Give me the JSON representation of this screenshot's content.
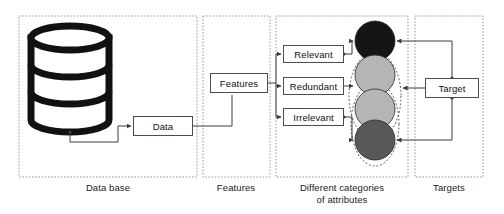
{
  "diagram": {
    "regions": [
      {
        "id": "database",
        "label": "Data base",
        "x": 19,
        "y": 16,
        "w": 178,
        "h": 161
      },
      {
        "id": "features",
        "label": "Features",
        "x": 203,
        "y": 16,
        "w": 67,
        "h": 161
      },
      {
        "id": "categories",
        "label": "Different categories\nof attributes",
        "x": 276,
        "y": 16,
        "w": 132,
        "h": 161
      },
      {
        "id": "targets",
        "label": "Targets",
        "x": 415,
        "y": 16,
        "w": 68,
        "h": 161
      }
    ],
    "boxes": [
      {
        "id": "data",
        "label": "Data",
        "x": 133,
        "y": 116,
        "w": 60,
        "h": 20
      },
      {
        "id": "features",
        "label": "Features",
        "x": 210,
        "y": 73,
        "w": 58,
        "h": 20
      },
      {
        "id": "relevant",
        "label": "Relevant",
        "x": 283,
        "y": 45,
        "w": 61,
        "h": 18
      },
      {
        "id": "redundant",
        "label": "Redundant",
        "x": 283,
        "y": 77,
        "w": 61,
        "h": 18
      },
      {
        "id": "irrelevant",
        "label": "Irrelevant",
        "x": 283,
        "y": 108,
        "w": 61,
        "h": 18
      },
      {
        "id": "target",
        "label": "Target",
        "x": 425,
        "y": 78,
        "w": 54,
        "h": 20
      }
    ],
    "cylinder": {
      "name": "database-cylinder",
      "cx": 70,
      "top": 26,
      "rx": 39,
      "ry": 12,
      "body_height": 94,
      "band_count": 3,
      "stroke": "#111111",
      "fill": "#ffffff"
    },
    "circles": [
      {
        "id": "attribute-node-1",
        "cx": 375,
        "cy": 41,
        "r": 20,
        "fill": "#151515",
        "category": "Relevant"
      },
      {
        "id": "attribute-node-2",
        "cx": 375,
        "cy": 75,
        "r": 20,
        "fill": "#b5b5b5",
        "category": "Redundant"
      },
      {
        "id": "attribute-node-3",
        "cx": 375,
        "cy": 109,
        "r": 20,
        "fill": "#b5b5b5",
        "category": "Redundant"
      },
      {
        "id": "attribute-node-4",
        "cx": 375,
        "cy": 140,
        "r": 20,
        "fill": "#585858",
        "category": "Irrelevant"
      }
    ],
    "ellipses": [
      {
        "id": "grouping-ellipse-upper",
        "cx": 375,
        "cy": 96,
        "rx": 26,
        "ry": 44
      },
      {
        "id": "grouping-ellipse-lower",
        "cx": 375,
        "cy": 124,
        "rx": 24,
        "ry": 42
      }
    ],
    "colors": {
      "region_border": "#9a9a9a",
      "connector": "#3c3c3c",
      "box_border": "#4c4c4c",
      "text": "#111111",
      "circle_dark": "#151515",
      "circle_light": "#b5b5b5",
      "circle_mid": "#585858"
    }
  }
}
